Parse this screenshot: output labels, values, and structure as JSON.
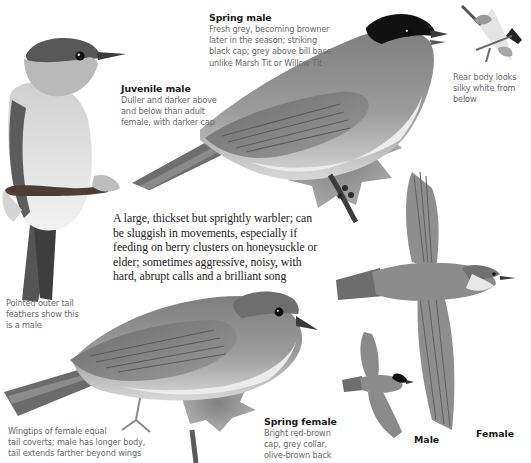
{
  "page": {
    "palette": {
      "background": "#ffffff",
      "plumage_grey": "#8a8a8a",
      "cap_black": "#111111",
      "underside": "#e6e6e6",
      "caption_text": "#6a6a6a",
      "heading_text": "#1a1a1a"
    }
  },
  "captions": {
    "spring_male": {
      "title": "Spring male",
      "lines": [
        "Fresh grey, becoming browner",
        "later in the season; striking",
        "black cap; grey above bill base",
        "unlike Marsh Tit or Willow Tit"
      ]
    },
    "juvenile_male": {
      "title": "Juvenile male",
      "lines": [
        "Duller and darker above",
        "and below than adult",
        "female, with darker cap"
      ]
    },
    "rear_body": {
      "lines": [
        "Rear body looks",
        "silky white from",
        "below"
      ]
    },
    "pointed_tail": {
      "lines": [
        "Pointed outer tail",
        "feathers show this",
        "is a male"
      ]
    },
    "wingtips": {
      "lines": [
        "Wingtips of female equal",
        "tail coverts; male has longer body,",
        "tail extends farther beyond wings"
      ]
    },
    "spring_female": {
      "title": "Spring female",
      "lines": [
        "Bright red-brown",
        "cap, grey collar,",
        "olive-brown back"
      ]
    }
  },
  "intro": {
    "lines": [
      "A large, thickset but sprightly warbler; can",
      "be sluggish in movements, especially if",
      "feeding on berry clusters on honeysuckle or",
      "elder; sometimes aggressive, noisy, with",
      "hard, abrupt calls and a brilliant song"
    ]
  },
  "flight_labels": {
    "male": "Male",
    "female": "Female"
  },
  "illustrations": [
    {
      "id": "juvenile-male-perched",
      "icon": "perched-bird-brown-cap"
    },
    {
      "id": "spring-male-perched",
      "icon": "perched-bird-black-cap"
    },
    {
      "id": "rear-body-view",
      "icon": "bird-from-below"
    },
    {
      "id": "spring-female-perched",
      "icon": "perched-bird-brown-cap"
    },
    {
      "id": "female-in-flight",
      "icon": "flying-bird"
    },
    {
      "id": "male-in-flight",
      "icon": "flying-bird-small"
    }
  ]
}
